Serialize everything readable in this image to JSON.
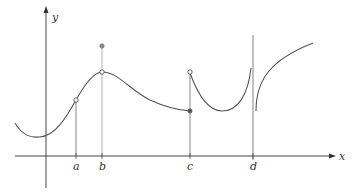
{
  "figure": {
    "type": "function graph with discontinuities",
    "axes": {
      "x_label": "x",
      "y_label": "y"
    },
    "ticks": [
      {
        "label": "a",
        "x": 76
      },
      {
        "label": "b",
        "x": 102
      },
      {
        "label": "c",
        "x": 190
      },
      {
        "label": "d",
        "x": 253
      }
    ],
    "points": [
      {
        "name": "a-hole",
        "kind": "open",
        "at": "a"
      },
      {
        "name": "b-hole",
        "kind": "open",
        "at": "b"
      },
      {
        "name": "b-value",
        "kind": "filled",
        "at": "b"
      },
      {
        "name": "c-hole",
        "kind": "open",
        "at": "c"
      },
      {
        "name": "c-value",
        "kind": "filled",
        "at": "c"
      }
    ],
    "colors": {
      "curve": "#555555",
      "axis": "#333333",
      "guide": "#888888"
    }
  }
}
